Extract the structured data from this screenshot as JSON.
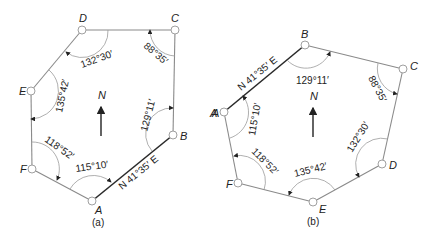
{
  "diagrams": [
    {
      "id": "a",
      "caption": "(a)",
      "north_label": "N",
      "bearing_label": "N 41°35′ E",
      "stations": [
        {
          "name": "A",
          "angle": "115°10′"
        },
        {
          "name": "B",
          "angle": "129°11′"
        },
        {
          "name": "C",
          "angle": "88°35′"
        },
        {
          "name": "D",
          "angle": "132°30′"
        },
        {
          "name": "E",
          "angle": "135°42′"
        },
        {
          "name": "F",
          "angle": "118°52′"
        }
      ]
    },
    {
      "id": "b",
      "caption": "(b)",
      "north_label": "N",
      "bearing_label": "N 41°35′ E",
      "stations": [
        {
          "name": "A",
          "angle": "115°10′"
        },
        {
          "name": "B",
          "angle": "129°11′"
        },
        {
          "name": "C",
          "angle": "88°35′"
        },
        {
          "name": "D",
          "angle": "132°30′"
        },
        {
          "name": "E",
          "angle": "135°42′"
        },
        {
          "name": "F",
          "angle": "118°52′"
        }
      ]
    }
  ],
  "stray_label": "A"
}
